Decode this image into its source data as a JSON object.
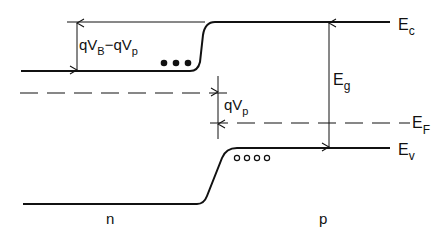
{
  "diagram": {
    "type": "energy-band-diagram",
    "labels": {
      "Ec": {
        "main": "E",
        "sub": "c"
      },
      "Eg": {
        "main": "E",
        "sub": "g"
      },
      "EF": {
        "main": "E",
        "sub": "F"
      },
      "Ev": {
        "main": "E",
        "sub": "v"
      },
      "barrier": {
        "q1": "qV",
        "sub1": "B",
        "minus": "−qV",
        "sub2": "p"
      },
      "qVp": {
        "main": "qV",
        "sub": "p"
      },
      "n_region": "n",
      "p_region": "p"
    },
    "carriers": {
      "electrons": "●●●",
      "holes": "○○○○"
    },
    "colors": {
      "line": "#111111",
      "background": "#ffffff"
    }
  }
}
